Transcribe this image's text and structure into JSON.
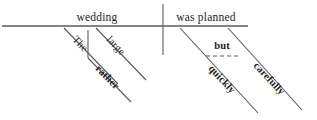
{
  "diagram": {
    "type": "reed-kellogg-sentence-diagram",
    "sentence": "The rather large wedding was planned quickly but carefully.",
    "colors": {
      "background": "#ffffff",
      "line": "#5a5a5a",
      "text": "#1d1d1d"
    },
    "baseline": {
      "subject_label": "wedding",
      "predicate_label": "was planned"
    },
    "modifiers": {
      "the": "The",
      "rather": "rather",
      "large": "large",
      "quickly": "quickly",
      "carefully": "carefully",
      "but": "but"
    }
  }
}
